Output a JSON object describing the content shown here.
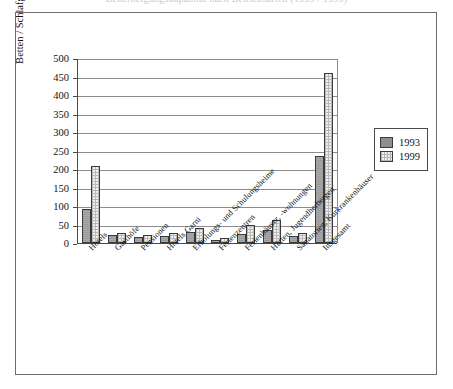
{
  "caption": {
    "text": "Beherbergungskapazität nach Betriebsarten (1993 / 1999)"
  },
  "legend": {
    "position": "right",
    "items": [
      {
        "label": "1993",
        "swatch": "dark-gray-solid"
      },
      {
        "label": "1999",
        "swatch": "light-dotted"
      }
    ]
  },
  "chart_data": {
    "type": "bar",
    "title": "",
    "xlabel": "",
    "ylabel": "Betten / Schlafgelegenheiten in 1.000",
    "ylim": [
      0,
      500
    ],
    "yticks": [
      0,
      50,
      100,
      150,
      200,
      250,
      300,
      350,
      400,
      450,
      500
    ],
    "grid": true,
    "categories": [
      "Hotels",
      "Gasthöfe",
      "Pensionen",
      "Hotels Garni",
      "Erholungs- und Schulungsheime",
      "Ferienzentren",
      "Ferienhäuser, -wohnungen",
      "Hütten, Jugendherbergen",
      "Sanatorien, Kurkrankenhäuser",
      "Insgesamt"
    ],
    "series": [
      {
        "name": "1993",
        "values": [
          93,
          21,
          16,
          20,
          30,
          9,
          25,
          36,
          20,
          235
        ]
      },
      {
        "name": "1999",
        "values": [
          208,
          27,
          22,
          28,
          40,
          14,
          50,
          62,
          26,
          460
        ]
      }
    ]
  }
}
